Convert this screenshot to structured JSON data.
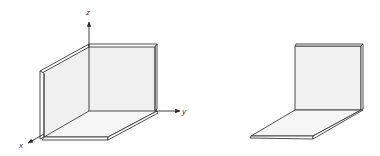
{
  "figure": {
    "left": {
      "description": "Corner bracket (L-shaped plate) placed in coordinate frame",
      "axes": {
        "x_label": "x",
        "y_label": "y",
        "z_label": "z"
      }
    },
    "right": {
      "description": "Corner bracket (L-shaped plate) without axes"
    }
  },
  "colors": {
    "stroke": "#3a3a3a",
    "fill": "#f4f4f4",
    "wall_fill": "#f0f0f0",
    "background": "#ffffff"
  }
}
